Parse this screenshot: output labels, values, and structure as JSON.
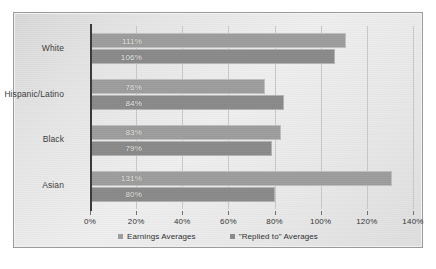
{
  "chart_data": {
    "type": "bar",
    "orientation": "horizontal",
    "title": "",
    "xlabel": "",
    "ylabel": "",
    "categories": [
      "White",
      "Hispanic/Latino",
      "Black",
      "Asian"
    ],
    "series": [
      {
        "name": "Earnings Averages",
        "color": "#9d9d9d",
        "values": [
          111,
          76,
          83,
          131
        ],
        "labels": [
          "111%",
          "76%",
          "83%",
          "131%"
        ]
      },
      {
        "name": "\"Replied to\" Averages",
        "color": "#8a8a8a",
        "values": [
          106,
          84,
          79,
          80
        ],
        "labels": [
          "106%",
          "84%",
          "79%",
          "80%"
        ]
      }
    ],
    "xlim": [
      0,
      140
    ],
    "xticks": [
      0,
      20,
      40,
      60,
      80,
      100,
      120,
      140
    ],
    "xtick_labels": [
      "0%",
      "20%",
      "40%",
      "60%",
      "80%",
      "100%",
      "120%",
      "140%"
    ],
    "grid": "vertical",
    "legend_position": "bottom"
  },
  "legend": {
    "items": [
      {
        "label": "Earnings Averages"
      },
      {
        "label": "\"Replied to\" Averages"
      }
    ]
  }
}
